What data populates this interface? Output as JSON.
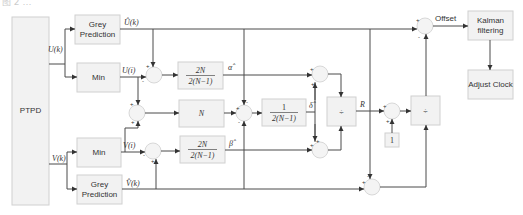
{
  "caption_partial": "图 2 …",
  "blocks": {
    "ptpd": "PTPD",
    "grey_top_line1": "Grey",
    "grey_top_line2": "Prediction",
    "grey_bot_line1": "Grey",
    "grey_bot_line2": "Prediction",
    "min_top": "Min",
    "min_bot": "Min",
    "gain_alpha_num": "2N",
    "gain_alpha_den": "2(N−1)",
    "gain_n": "N",
    "gain_delta_num": "1",
    "gain_delta_den": "2(N−1)",
    "gain_beta_num": "2N",
    "gain_beta_den": "2(N−1)",
    "divide_1": "÷",
    "divide_2": "÷",
    "const_one": "1",
    "kalman_line1": "Kalman",
    "kalman_line2": "filtering",
    "adjust_clock": "Adjust Clock"
  },
  "signals": {
    "u_k": "U(k)",
    "v_k": "V(k)",
    "u_hat": "Û(k)",
    "v_hat": "V̂(k)",
    "u_min": "U(i)",
    "v_min": "V(i)",
    "alpha_hat": "α̂",
    "beta_hat": "β̂",
    "delta_hat": "δ̂",
    "r": "R",
    "offset": "Offset"
  },
  "signs": {
    "plus": "+",
    "minus": "-"
  }
}
